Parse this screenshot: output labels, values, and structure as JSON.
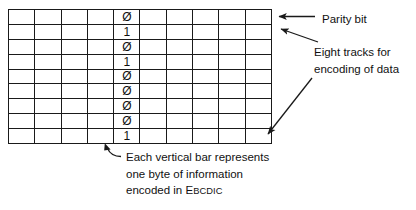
{
  "figure": {
    "type": "magnetic-tape-encoding-diagram",
    "grid": {
      "columns": 10,
      "rows": 9,
      "marked_column_index": 5,
      "marked_column_bits": [
        "Ø",
        "1",
        "Ø",
        "1",
        "Ø",
        "Ø",
        "Ø",
        "Ø",
        "1"
      ]
    }
  },
  "annotations": {
    "parity": {
      "text": "Parity bit"
    },
    "tracks": {
      "line1": "Eight tracks for",
      "line2": "encoding of data"
    },
    "byte": {
      "line1": "Each vertical bar represents",
      "line2": "one byte of information",
      "line3_prefix": "encoded in ",
      "line3_acronym_cap": "E",
      "line3_acronym_rest": "BCDIC"
    }
  },
  "colors": {
    "ink": "#1a1a1a",
    "paper": "#ffffff"
  }
}
